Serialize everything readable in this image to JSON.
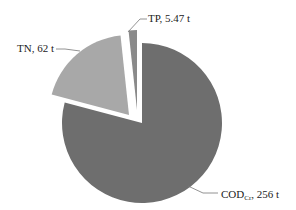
{
  "chart_data": {
    "type": "pie",
    "title": "",
    "unit": "t",
    "slices": [
      {
        "name": "COD",
        "subscript": "Cr",
        "value": 256,
        "label": "COD",
        "label_suffix": ", 256 t",
        "color": "#6e6e6e",
        "exploded": false
      },
      {
        "name": "TN",
        "value": 62,
        "label": "TN, 62 t",
        "color": "#a8a8a8",
        "exploded": true
      },
      {
        "name": "TP",
        "value": 5.47,
        "label": "TP, 5.47 t",
        "color": "#8a8a8a",
        "exploded": true
      }
    ],
    "start_angle_deg": 0,
    "direction": "clockwise",
    "legend": "none",
    "data_labels": "outside with leader lines"
  },
  "labels": {
    "cod_main": "COD",
    "cod_sub": "Cr",
    "cod_rest": ", 256 t",
    "tn": "TN, 62 t",
    "tp": "TP, 5.47 t"
  }
}
